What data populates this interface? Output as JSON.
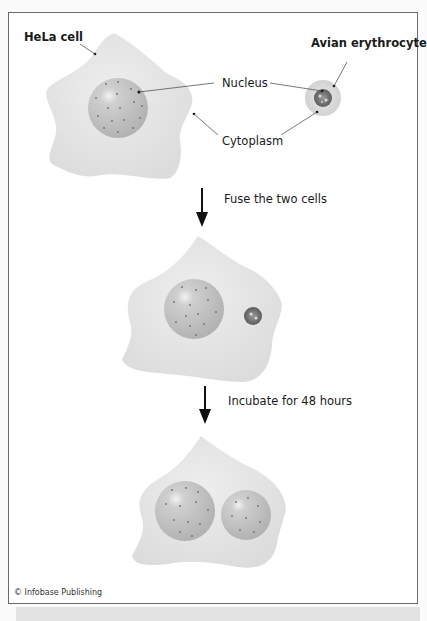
{
  "labels": {
    "hela_cell": "HeLa cell",
    "avian_erythrocyte": "Avian erythrocyte",
    "nucleus": "Nucleus",
    "cytoplasm": "Cytoplasm"
  },
  "steps": [
    {
      "label": "Fuse the two cells"
    },
    {
      "label": "Incubate for 48 hours"
    }
  ],
  "credit": "© Infobase Publishing",
  "colors": {
    "cytoplasm": "#e4e4e4",
    "nucleus": "#bdbdbd",
    "erythrocyte_nucleus": "#6a6a6a",
    "arrow": "#111111",
    "border": "#6a6a6a"
  }
}
